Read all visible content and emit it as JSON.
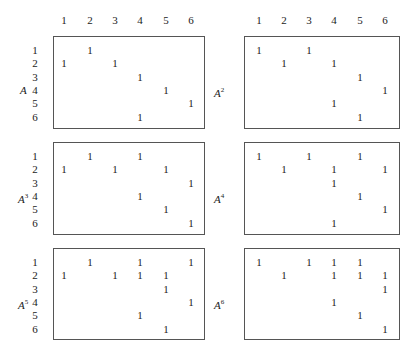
{
  "column_headers": [
    "1",
    "2",
    "3",
    "4",
    "5",
    "6"
  ],
  "row_labels": [
    "1",
    "2",
    "3",
    "4",
    "5",
    "6"
  ],
  "matrices": [
    {
      "name": "A",
      "power": "",
      "rows": [
        [
          2
        ],
        [
          1,
          3
        ],
        [
          4
        ],
        [
          5
        ],
        [
          6
        ],
        [
          4
        ]
      ]
    },
    {
      "name": "A",
      "power": "2",
      "rows": [
        [
          1,
          3
        ],
        [
          2,
          4
        ],
        [
          5
        ],
        [
          6
        ],
        [
          4
        ],
        [
          5
        ]
      ]
    },
    {
      "name": "A",
      "power": "3",
      "rows": [
        [
          2,
          4
        ],
        [
          1,
          3,
          5
        ],
        [
          6
        ],
        [
          4
        ],
        [
          5
        ],
        [
          6
        ]
      ]
    },
    {
      "name": "A",
      "power": "4",
      "rows": [
        [
          1,
          3,
          5
        ],
        [
          2,
          4,
          6
        ],
        [
          4
        ],
        [
          5
        ],
        [
          6
        ],
        [
          4
        ]
      ]
    },
    {
      "name": "A",
      "power": "5",
      "rows": [
        [
          2,
          4,
          6
        ],
        [
          1,
          3,
          4,
          5
        ],
        [
          5
        ],
        [
          6
        ],
        [
          4
        ],
        [
          5
        ]
      ]
    },
    {
      "name": "A",
      "power": "6",
      "rows": [
        [
          1,
          3,
          4,
          5
        ],
        [
          2,
          4,
          5,
          6
        ],
        [
          6
        ],
        [
          4
        ],
        [
          5
        ],
        [
          6
        ]
      ]
    }
  ],
  "entry_value": "1"
}
